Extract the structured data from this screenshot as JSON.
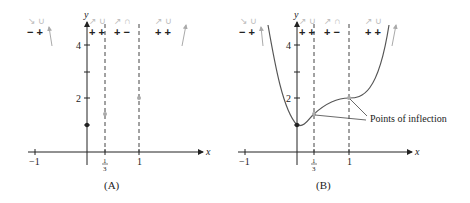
{
  "panels": [
    {
      "id": "A",
      "caption": "(A)",
      "x_axis_label": "x",
      "y_axis_label": "y",
      "x_ticks": [
        "−1",
        "1/3",
        "1"
      ],
      "y_ticks": [
        "4",
        "2"
      ],
      "sign_groups": [
        {
          "shapes": "↘ ∪",
          "signs": "− +"
        },
        {
          "shapes": "↗ ∪",
          "signs": "+ +"
        },
        {
          "shapes": "↗ ∩",
          "signs": "+ −"
        },
        {
          "shapes": "↗ ∪",
          "signs": "+ +"
        }
      ],
      "points": [
        {
          "x": 0,
          "y": 1,
          "style": "solid"
        },
        {
          "x": 0.3333,
          "y": 1.41,
          "style": "gray"
        },
        {
          "x": 1,
          "y": 2,
          "style": "gray"
        }
      ]
    },
    {
      "id": "B",
      "caption": "(B)",
      "x_axis_label": "x",
      "y_axis_label": "y",
      "x_ticks": [
        "−1",
        "1/3",
        "1"
      ],
      "y_ticks": [
        "4",
        "2"
      ],
      "sign_groups": [
        {
          "shapes": "↘ ∪",
          "signs": "− +"
        },
        {
          "shapes": "↗ ∪",
          "signs": "+ +"
        },
        {
          "shapes": "↗ ∩",
          "signs": "+ −"
        },
        {
          "shapes": "↗ ∪",
          "signs": "+ +"
        }
      ],
      "annotation": "Points of inflection",
      "function": "y = 3x^4 − 8x^3 + 6x^2 + 1",
      "points": [
        {
          "x": 0,
          "y": 1,
          "label": "local min"
        },
        {
          "x": 0.3333,
          "y": 1.41,
          "label": "inflection"
        },
        {
          "x": 1,
          "y": 2,
          "label": "inflection"
        }
      ]
    }
  ],
  "labels": {
    "frac_num": "1",
    "frac_den": "3",
    "neg_one": "−1",
    "one": "1",
    "four": "4",
    "two": "2",
    "x": "x",
    "y": "y",
    "signA1": "− +",
    "signA2": "+ +",
    "signA3": "+ −",
    "signA4": "+ +",
    "capA": "(A)",
    "capB": "(B)",
    "poi": "Points of inflection"
  }
}
